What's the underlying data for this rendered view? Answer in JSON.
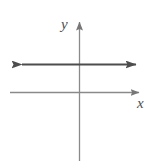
{
  "figure": {
    "kind": "coordinate-plane-graph",
    "width": 157,
    "height": 161,
    "background_color": "#ffffff"
  },
  "labels": {
    "y_axis": "y",
    "x_axis": "x"
  },
  "colors": {
    "axis": "#8a8a8a",
    "graph_line": "#4d4d4d",
    "label_text": "#4d4d4d",
    "background": "#ffffff"
  },
  "chart_data": {
    "type": "line",
    "title": "",
    "subtitle": "",
    "xlabel": "x",
    "ylabel": "y",
    "grid": false,
    "legend": null,
    "annotations": [],
    "axes": {
      "x_axis": {
        "label": "x",
        "orientation": "horizontal",
        "pixel_y": 92,
        "pixel_x_start": 10,
        "pixel_x_end": 146,
        "arrow_start": false,
        "arrow_end": true,
        "tick_labels": [],
        "xlim": null
      },
      "y_axis": {
        "label": "y",
        "orientation": "vertical",
        "pixel_x": 79,
        "pixel_y_start": 161,
        "pixel_y_end": 17,
        "arrow_start": false,
        "arrow_end": true,
        "tick_labels": [],
        "ylim": null
      },
      "origin_pixel": {
        "x": 79,
        "y": 92
      }
    },
    "series": [
      {
        "name": "horizontal line",
        "description": "constant function: a horizontal line above the x-axis, extending infinitely in both directions",
        "shape": "horizontal-line",
        "arrow_start": true,
        "arrow_end": true,
        "pixel_y": 64,
        "pixel_x_start": 12,
        "pixel_x_end": 145,
        "x": [
          12,
          145
        ],
        "values": [
          64,
          64
        ]
      }
    ]
  }
}
